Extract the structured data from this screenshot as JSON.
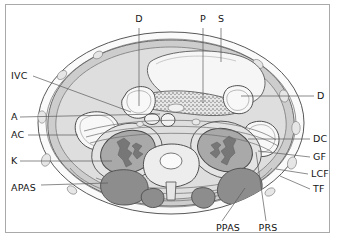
{
  "figure": {
    "frame_color": "#a9a9a9",
    "background": "#ffffff"
  },
  "palette": {
    "outline": "#4a4a4a",
    "skin_fat": "#f7f7f7",
    "subcutaneous_fat": "#efefef",
    "muscle_wall": "#c9c9c9",
    "retroperitoneal_fat": "#d6d6d6",
    "organ_light": "#f4f4f4",
    "kidney": "#a8a8a8",
    "kidney_sinus": "#7d7d7d",
    "paraspinal_muscle": "#8e8e8e",
    "vertebra": "#e2e2e2",
    "pancreas_stipple": "#9a9a9a",
    "leader_line": "#5a5a5a"
  },
  "labels": [
    {
      "id": "D-top",
      "text": "D",
      "meaning": "duodenum",
      "side": "top",
      "x": 139,
      "y": 19,
      "anchor": "center",
      "leader": [
        [
          139,
          28
        ],
        [
          139,
          106
        ]
      ]
    },
    {
      "id": "P",
      "text": "P",
      "meaning": "pancreas",
      "side": "top",
      "x": 203,
      "y": 19,
      "anchor": "center",
      "leader": [
        [
          203,
          28
        ],
        [
          203,
          103
        ]
      ]
    },
    {
      "id": "S",
      "text": "S",
      "meaning": "stomach",
      "side": "top",
      "x": 221,
      "y": 19,
      "anchor": "center",
      "leader": [
        [
          221,
          28
        ],
        [
          221,
          62
        ]
      ]
    },
    {
      "id": "IVC",
      "text": "IVC",
      "meaning": "inferior vena cava",
      "side": "left",
      "x": 11,
      "y": 76,
      "anchor": "left",
      "leader": [
        [
          33,
          76
        ],
        [
          131,
          112
        ]
      ]
    },
    {
      "id": "A",
      "text": "A",
      "meaning": "aorta",
      "side": "left",
      "x": 11,
      "y": 117,
      "anchor": "left",
      "leader": [
        [
          20,
          117
        ],
        [
          160,
          114
        ]
      ]
    },
    {
      "id": "AC",
      "text": "AC",
      "meaning": "ascending colon",
      "side": "left",
      "x": 11,
      "y": 135,
      "anchor": "left",
      "leader": [
        [
          28,
          135
        ],
        [
          78,
          135
        ]
      ]
    },
    {
      "id": "K",
      "text": "K",
      "meaning": "kidney",
      "side": "left",
      "x": 11,
      "y": 161,
      "anchor": "left",
      "leader": [
        [
          20,
          161
        ],
        [
          112,
          161
        ]
      ]
    },
    {
      "id": "APAS",
      "text": "APAS",
      "meaning": "anterior pararenal space",
      "side": "left",
      "x": 11,
      "y": 188,
      "anchor": "left",
      "leader": [
        [
          41,
          185
        ],
        [
          108,
          183
        ]
      ]
    },
    {
      "id": "D-right",
      "text": "D",
      "meaning": "duodenum",
      "side": "right",
      "x": 317,
      "y": 96,
      "anchor": "left",
      "leader": [
        [
          241,
          96
        ],
        [
          314,
          96
        ]
      ]
    },
    {
      "id": "DC",
      "text": "DC",
      "meaning": "descending colon",
      "side": "right",
      "x": 313,
      "y": 139,
      "anchor": "left",
      "leader": [
        [
          248,
          139
        ],
        [
          310,
          139
        ]
      ]
    },
    {
      "id": "GF",
      "text": "GF",
      "meaning": "Gerota fascia",
      "side": "right",
      "x": 313,
      "y": 157,
      "anchor": "left",
      "leader": [
        [
          258,
          151
        ],
        [
          310,
          157
        ]
      ]
    },
    {
      "id": "LCF",
      "text": "LCF",
      "meaning": "lateroconal fascia",
      "side": "right",
      "x": 311,
      "y": 174,
      "anchor": "left",
      "leader": [
        [
          276,
          169
        ],
        [
          308,
          174
        ]
      ]
    },
    {
      "id": "TF",
      "text": "TF",
      "meaning": "transversalis fascia",
      "side": "right",
      "x": 313,
      "y": 189,
      "anchor": "left",
      "leader": [
        [
          280,
          176
        ],
        [
          310,
          189
        ]
      ]
    },
    {
      "id": "PPAS",
      "text": "PPAS",
      "meaning": "posterior pararenal space",
      "side": "bottom",
      "x": 228,
      "y": 228,
      "anchor": "center",
      "leader": [
        [
          222,
          221
        ],
        [
          245,
          188
        ]
      ]
    },
    {
      "id": "PRS",
      "text": "PRS",
      "meaning": "perirenal space",
      "side": "bottom",
      "x": 268,
      "y": 228,
      "anchor": "center",
      "leader": [
        [
          266,
          221
        ],
        [
          256,
          152
        ]
      ]
    }
  ],
  "anatomy": [
    {
      "name": "body-wall-outline",
      "note": "oval torso cross-section"
    },
    {
      "name": "subcutaneous-fat-layer",
      "note": "pale outer rim with small vessel ovals"
    },
    {
      "name": "abdominal-wall-muscle",
      "note": "mid gray band"
    },
    {
      "name": "stomach",
      "note": "large pale anterior-left structure"
    },
    {
      "name": "pancreas",
      "note": "stippled transverse band"
    },
    {
      "name": "duodenum-right",
      "note": "pale rounded loop, right"
    },
    {
      "name": "duodenum-left",
      "note": "pale rounded loop, left"
    },
    {
      "name": "ascending-colon",
      "note": "pale loop, right flank"
    },
    {
      "name": "descending-colon",
      "note": "pale loop, left flank"
    },
    {
      "name": "right-kidney",
      "note": "gray ellipse with dark sinus"
    },
    {
      "name": "left-kidney",
      "note": "gray ellipse with dark sinus"
    },
    {
      "name": "aorta",
      "note": "small midline vessel"
    },
    {
      "name": "inferior-vena-cava",
      "note": "small midline vessel right of aorta"
    },
    {
      "name": "vertebral-body",
      "note": "posterior midline bone"
    },
    {
      "name": "spinal-canal",
      "note": "pale oval within vertebra"
    },
    {
      "name": "paraspinal-muscles",
      "note": "dark gray posterior masses"
    },
    {
      "name": "psoas-muscles",
      "note": "dark gray paravertebral masses"
    }
  ]
}
